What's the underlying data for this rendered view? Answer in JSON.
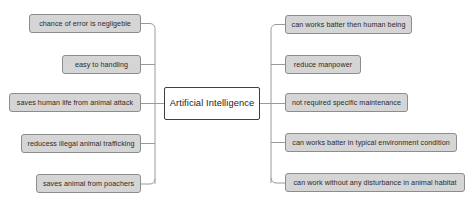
{
  "diagram": {
    "type": "mind-map",
    "background_color": "#ffffff",
    "central_node": {
      "label": "Artificial Intelligence",
      "x": 164,
      "y": 87,
      "width": 96,
      "height": 33,
      "fill": "#ffffff",
      "border_color": "#3f3f3f"
    },
    "node_fill": "#d5d5d5",
    "node_border": "#8d8d8d",
    "connector_color": "#9a9a9a",
    "left_branch": {
      "spine_x": 155,
      "nodes": [
        {
          "label": "chance of error is negligeble",
          "x": 29,
          "y": 14,
          "width": 112,
          "height": 19
        },
        {
          "label": "easy to handling",
          "x": 62,
          "y": 55,
          "width": 79,
          "height": 19
        },
        {
          "label": "saves human life from animal attack",
          "x": 9,
          "y": 93,
          "width": 132,
          "height": 19
        },
        {
          "label": "reducess illegal animal trafficking",
          "x": 21,
          "y": 134,
          "width": 120,
          "height": 19
        },
        {
          "label": "saves animal from poachers",
          "x": 36,
          "y": 174,
          "width": 105,
          "height": 19
        }
      ]
    },
    "right_branch": {
      "spine_x": 271,
      "nodes": [
        {
          "label": "can works batter then human being",
          "x": 285,
          "y": 15,
          "width": 127,
          "height": 19
        },
        {
          "label": "reduce manpower",
          "x": 285,
          "y": 55,
          "width": 76,
          "height": 19
        },
        {
          "label": "not required specific maintenance",
          "x": 285,
          "y": 93,
          "width": 123,
          "height": 19
        },
        {
          "label": "can works batter in typical environment condition",
          "x": 285,
          "y": 133,
          "width": 172,
          "height": 19
        },
        {
          "label": "can work without any disturbance in animal habitat",
          "x": 285,
          "y": 173,
          "width": 180,
          "height": 19
        }
      ]
    }
  }
}
